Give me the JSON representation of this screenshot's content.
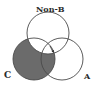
{
  "diagram": {
    "type": "venn",
    "sets": [
      {
        "id": "nonb",
        "label": "Non-B",
        "cx": 48,
        "cy": 33,
        "r": 21
      },
      {
        "id": "c",
        "label": "C",
        "cx": 34,
        "cy": 59,
        "r": 21
      },
      {
        "id": "a",
        "label": "A",
        "cx": 62,
        "cy": 59,
        "r": 21
      }
    ],
    "shaded_region": "C minus Non-B",
    "colors": {
      "stroke": "#4a4a4a",
      "shade": "#6b6b6b",
      "background": "#ffffff"
    }
  },
  "labels": {
    "nonb": "Non-B",
    "c": "C",
    "a": "A"
  }
}
